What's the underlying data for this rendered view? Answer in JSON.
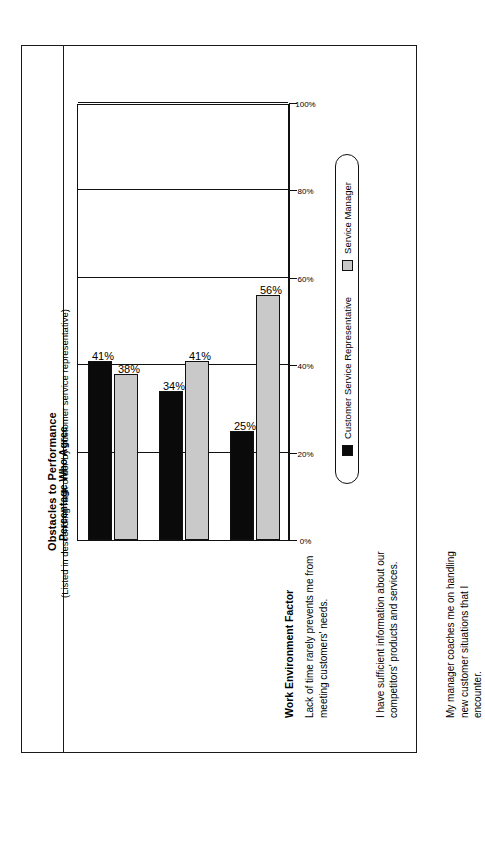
{
  "document": {
    "title": "Obstacles to Performance",
    "subtitle": "(Listed in descending rank order by customer service representative)"
  },
  "table": {
    "category_header": "Work Environment Factor"
  },
  "legend": {
    "position": "bottom",
    "items": [
      {
        "label": "Customer Service Representative",
        "color": "#0a0a0a",
        "swatch": "black-square-swatch"
      },
      {
        "label": "Service Manager",
        "color": "#c9c9c9",
        "swatch": "gray-square-swatch"
      }
    ]
  },
  "chart_data": {
    "type": "bar",
    "title": "Percentage Who Agree",
    "xlabel": "Work Environment Factor",
    "ylabel": "Percentage Who Agree",
    "ylim": [
      0,
      100
    ],
    "grid": true,
    "orientation": "rotated-90-vertical-bars",
    "tick_labels": [
      "0%",
      "20%",
      "40%",
      "60%",
      "80%",
      "100%"
    ],
    "ticks": [
      0,
      20,
      40,
      60,
      80,
      100
    ],
    "categories": [
      "Lack of time rarely prevents me from meeting customers' needs.",
      "I have sufficient information about our competitors' products and services.",
      "My manager coaches me on handling new customer situations that I encounter."
    ],
    "series": [
      {
        "name": "Customer Service Representative",
        "color": "#0a0a0a",
        "values": [
          41,
          34,
          25
        ],
        "labels": [
          "41%",
          "34%",
          "25%"
        ]
      },
      {
        "name": "Service Manager",
        "color": "#c9c9c9",
        "values": [
          38,
          41,
          56
        ],
        "labels": [
          "38%",
          "41%",
          "56%"
        ]
      }
    ]
  }
}
